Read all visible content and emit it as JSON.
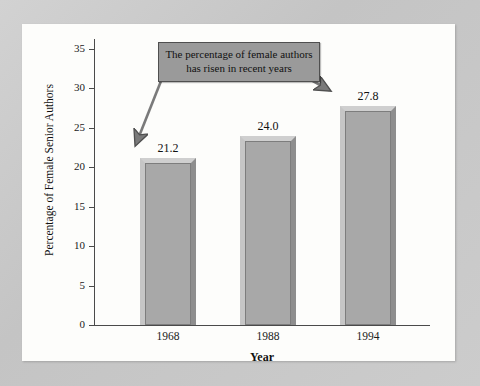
{
  "chart_data": {
    "type": "bar",
    "title": "",
    "categories": [
      "1968",
      "1988",
      "1994"
    ],
    "values": [
      21.2,
      24.0,
      27.8
    ],
    "value_labels": [
      "21.2",
      "24.0",
      "27.8"
    ],
    "xlabel": "Year",
    "ylabel": "Percentage of Female Senior Authors",
    "ylim": [
      0,
      35
    ],
    "yticks": [
      0,
      5,
      10,
      15,
      20,
      25,
      30,
      35
    ],
    "ytick_labels": [
      "0",
      "5",
      "10",
      "15",
      "20",
      "25",
      "30",
      "35"
    ],
    "grid": false,
    "legend": "none",
    "annotations": [
      {
        "id": "callout",
        "line1": "The percentage of female authors",
        "line2": "has risen in recent years",
        "arrows": [
          "points-to-bar-1968",
          "points-to-bar-1994"
        ]
      }
    ],
    "colors": {
      "bar_face": "#a8a8a8",
      "bar_highlight": "#cfcfcf",
      "bar_shadow": "#8e8e8e",
      "axis": "#4a4a4a",
      "annotation_fill": "#9a9a9a",
      "annotation_border": "#4f4f4f",
      "panel_background": "#fdfdfb",
      "page_background": "#c9c9c9",
      "text": "#111111"
    }
  }
}
